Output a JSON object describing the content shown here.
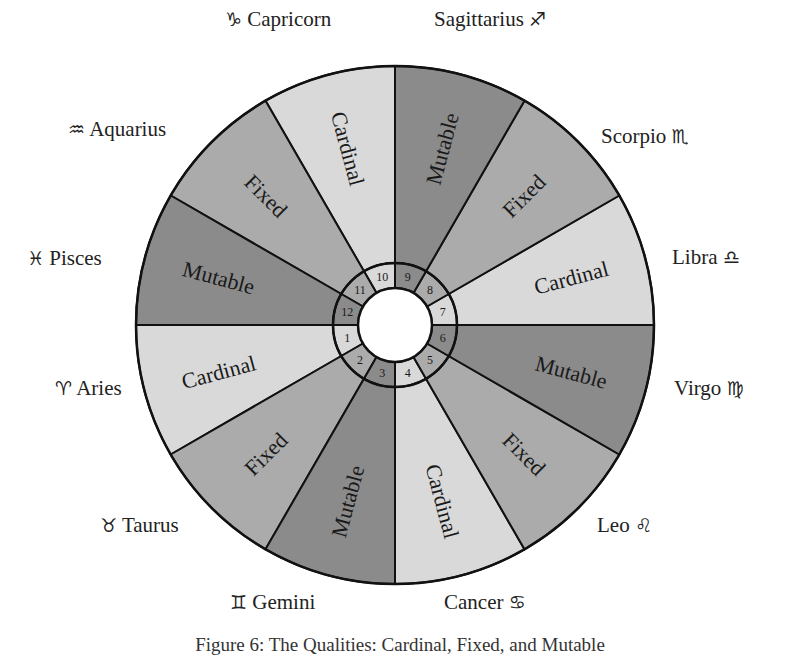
{
  "diagram": {
    "center": [
      395,
      325
    ],
    "outer_radius": 259,
    "ring_outer_radius": 62,
    "ring_inner_radius": 37,
    "colors": {
      "Cardinal": "#d9d9d9",
      "Fixed": "#ababab",
      "Mutable": "#8b8b8b",
      "stroke": "#111111",
      "text": "#1a1a1a"
    },
    "signs": [
      {
        "number": "1",
        "name": "Aries",
        "glyph": "♈",
        "quality": "Cardinal",
        "start_angle": 180,
        "label_x": 55,
        "label_y": 378,
        "glyph_first": true
      },
      {
        "number": "2",
        "name": "Taurus",
        "glyph": "♉",
        "quality": "Fixed",
        "start_angle": 210,
        "label_x": 100,
        "label_y": 515,
        "glyph_first": true
      },
      {
        "number": "3",
        "name": "Gemini",
        "glyph": "♊",
        "quality": "Mutable",
        "start_angle": 240,
        "label_x": 230,
        "label_y": 592,
        "glyph_first": true
      },
      {
        "number": "4",
        "name": "Cancer",
        "glyph": "♋",
        "quality": "Cardinal",
        "start_angle": 270,
        "label_x": 444,
        "label_y": 592,
        "glyph_first": false
      },
      {
        "number": "5",
        "name": "Leo",
        "glyph": "♌",
        "quality": "Fixed",
        "start_angle": 300,
        "label_x": 597,
        "label_y": 515,
        "glyph_first": false
      },
      {
        "number": "6",
        "name": "Virgo",
        "glyph": "♍",
        "quality": "Mutable",
        "start_angle": 330,
        "label_x": 674,
        "label_y": 378,
        "glyph_first": false
      },
      {
        "number": "7",
        "name": "Libra",
        "glyph": "♎",
        "quality": "Cardinal",
        "start_angle": 0,
        "label_x": 672,
        "label_y": 247,
        "glyph_first": false
      },
      {
        "number": "8",
        "name": "Scorpio",
        "glyph": "♏",
        "quality": "Fixed",
        "start_angle": 30,
        "label_x": 601,
        "label_y": 126,
        "glyph_first": false
      },
      {
        "number": "9",
        "name": "Sagittarius",
        "glyph": "♐",
        "quality": "Mutable",
        "start_angle": 60,
        "label_x": 434,
        "label_y": 9,
        "glyph_first": false
      },
      {
        "number": "10",
        "name": "Capricorn",
        "glyph": "♑",
        "quality": "Cardinal",
        "start_angle": 90,
        "label_x": 225,
        "label_y": 9,
        "glyph_first": true
      },
      {
        "number": "11",
        "name": "Aquarius",
        "glyph": "♒",
        "quality": "Fixed",
        "start_angle": 120,
        "label_x": 68,
        "label_y": 119,
        "glyph_first": true
      },
      {
        "number": "12",
        "name": "Pisces",
        "glyph": "♓",
        "quality": "Mutable",
        "start_angle": 150,
        "label_x": 27,
        "label_y": 248,
        "glyph_first": true
      }
    ]
  },
  "caption": "Figure 6: The Qualities: Cardinal, Fixed, and Mutable"
}
